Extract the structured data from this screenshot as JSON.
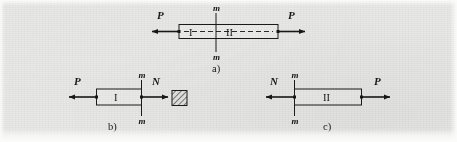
{
  "figure": {
    "background_color": "#e8e8e6",
    "ink_color": "#17171a",
    "bar_fill_color": "#ebebe9"
  },
  "panels": [
    {
      "id": "a",
      "caption": "a)",
      "description": "Whole bar in equilibrium under equal and opposite axial forces P, with cut section m-m",
      "left_force_label": "P",
      "right_force_label": "P",
      "part_left_label": "I",
      "part_right_label": "II",
      "section_label_top": "m",
      "section_label_bottom": "m"
    },
    {
      "id": "b",
      "caption": "b)",
      "description": "Left free body I with external force P and internal normal force N at section m-m",
      "left_force_label": "P",
      "right_force_label": "N",
      "part_label": "I",
      "section_label_top": "m",
      "section_label_bottom": "m"
    },
    {
      "id": "c",
      "caption": "c)",
      "description": "Right free body II with internal normal force N at section m-m and external force P",
      "left_force_label": "N",
      "right_force_label": "P",
      "part_label": "II",
      "section_label_top": "m",
      "section_label_bottom": "m"
    }
  ],
  "cross_section_symbol": {
    "name": "hatched-cross-section",
    "description": "Small square with 45-degree hatching representing the cut cross-section area"
  }
}
